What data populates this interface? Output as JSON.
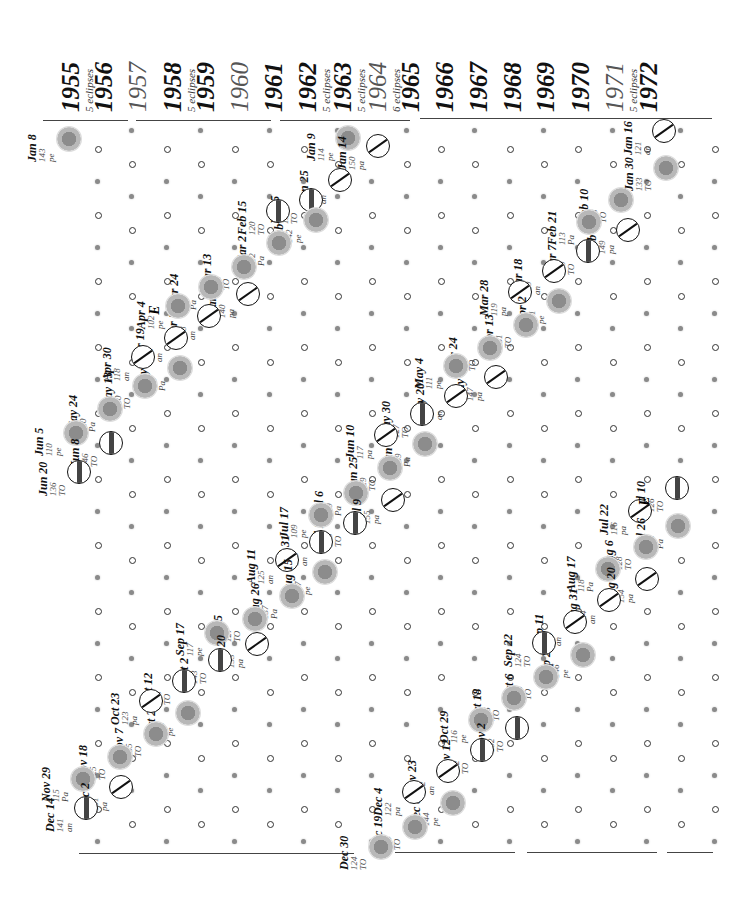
{
  "years": [
    {
      "year": "1955",
      "note": "5 eclipses",
      "style": "bold"
    },
    {
      "year": "1956",
      "note": "",
      "style": "bold"
    },
    {
      "year": "1957",
      "note": "",
      "style": "light"
    },
    {
      "year": "1958",
      "note": "5 eclipses",
      "style": "bold"
    },
    {
      "year": "1959",
      "note": "",
      "style": "bold"
    },
    {
      "year": "1960",
      "note": "",
      "style": "light"
    },
    {
      "year": "1961",
      "note": "",
      "style": "bold"
    },
    {
      "year": "1962",
      "note": "5 eclipses",
      "style": "bold"
    },
    {
      "year": "1963",
      "note": "5 eclipses",
      "style": "bold"
    },
    {
      "year": "1964",
      "note": "6 eclipses",
      "style": "light"
    },
    {
      "year": "1965",
      "note": "",
      "style": "bold"
    },
    {
      "year": "1966",
      "note": "",
      "style": "bold"
    },
    {
      "year": "1967",
      "note": "",
      "style": "bold"
    },
    {
      "year": "1968",
      "note": "",
      "style": "bold"
    },
    {
      "year": "1969",
      "note": "",
      "style": "bold"
    },
    {
      "year": "1970",
      "note": "",
      "style": "bold"
    },
    {
      "year": "1971",
      "note": "5 eclipses",
      "style": "light"
    },
    {
      "year": "1972",
      "note": "",
      "style": "bold"
    }
  ],
  "eclipses": [
    {
      "date": "Jan 8",
      "saros": "143",
      "type": "pe",
      "kind": "solar",
      "x": 68,
      "y": 138
    },
    {
      "date": "Jan 9",
      "saros": "114",
      "type": "pe",
      "kind": "solar",
      "x": 347,
      "y": 137
    },
    {
      "date": "Jan 14",
      "saros": "150",
      "type": "pa",
      "kind": "lunar",
      "x": 378,
      "y": 146
    },
    {
      "date": "Jan 25",
      "saros": "140",
      "type": "an",
      "kind": "lunar-part",
      "x": 340,
      "y": 180
    },
    {
      "date": "Feb 5",
      "saros": "130",
      "type": "TO",
      "kind": "lunar-tot",
      "x": 311,
      "y": 200
    },
    {
      "date": "Feb 19",
      "saros": "142",
      "type": "pe",
      "kind": "solar",
      "x": 315,
      "y": 219
    },
    {
      "date": "Feb 15",
      "saros": "120",
      "type": "TO",
      "kind": "lunar-tot",
      "x": 278,
      "y": 211
    },
    {
      "date": "Mar 2",
      "saros": "112",
      "type": "Pa",
      "kind": "solar",
      "x": 278,
      "y": 242
    },
    {
      "date": "Mar 13",
      "saros": "122",
      "type": "TO",
      "kind": "solar",
      "x": 243,
      "y": 266
    },
    {
      "date": "Mar 27",
      "saros": "140",
      "type": "pa",
      "kind": "lunar-part",
      "x": 248,
      "y": 294
    },
    {
      "date": "Mar 24",
      "saros": "112",
      "type": "Pa",
      "kind": "solar",
      "x": 210,
      "y": 286
    },
    {
      "date": "Apr 8",
      "saros": "138",
      "type": "an",
      "kind": "lunar-part",
      "x": 209,
      "y": 316
    },
    {
      "date": "Apr 4",
      "saros": "102",
      "type": "pe",
      "kind": "solar",
      "x": 177,
      "y": 305
    },
    {
      "date": "Apr 19",
      "saros": "128",
      "type": "an",
      "kind": "lunar-part",
      "x": 176,
      "y": 338
    },
    {
      "date": "May 3",
      "saros": "140",
      "type": "Pa",
      "kind": "solar",
      "x": 179,
      "y": 367
    },
    {
      "date": "Apr 30",
      "saros": "118",
      "type": "an",
      "kind": "lunar-part",
      "x": 143,
      "y": 357
    },
    {
      "date": "May 13",
      "saros": "130",
      "type": "TO",
      "kind": "solar",
      "x": 144,
      "y": 385
    },
    {
      "date": "May 24",
      "saros": "120",
      "type": "Pa",
      "kind": "solar",
      "x": 109,
      "y": 408
    },
    {
      "date": "Jun 5",
      "saros": "110",
      "type": "pe",
      "kind": "solar",
      "x": 75,
      "y": 432
    },
    {
      "date": "Jun 8",
      "saros": "146",
      "type": "TO",
      "kind": "lunar-tot",
      "x": 111,
      "y": 443
    },
    {
      "date": "Jun 20",
      "saros": "136",
      "type": "TO",
      "kind": "lunar-tot",
      "x": 79,
      "y": 472
    },
    {
      "date": "Feb 10",
      "saros": "123",
      "type": "TO",
      "kind": "solar",
      "x": 620,
      "y": 199
    },
    {
      "date": "Jan 30",
      "saros": "133",
      "type": "TO",
      "kind": "solar",
      "x": 665,
      "y": 167
    },
    {
      "date": "Jan 16",
      "saros": "121",
      "type": "an",
      "kind": "lunar-part",
      "x": 664,
      "y": 131
    },
    {
      "date": "Feb 25",
      "saros": "149",
      "type": "pa",
      "kind": "lunar-part",
      "x": 628,
      "y": 230
    },
    {
      "date": "Feb 21",
      "saros": "113",
      "type": "Pa",
      "kind": "solar",
      "x": 588,
      "y": 221
    },
    {
      "date": "Mar 7",
      "saros": "139",
      "type": "TO",
      "kind": "lunar-tot",
      "x": 588,
      "y": 251
    },
    {
      "date": "Mar 18",
      "saros": "129",
      "type": "an",
      "kind": "lunar-part",
      "x": 554,
      "y": 271
    },
    {
      "date": "Mar 28",
      "saros": "119",
      "type": "pa",
      "kind": "lunar-part",
      "x": 520,
      "y": 292
    },
    {
      "date": "Apr 2",
      "saros": "141",
      "type": "pe",
      "kind": "solar",
      "x": 558,
      "y": 300
    },
    {
      "date": "Apr 13",
      "saros": "131",
      "type": "TO",
      "kind": "solar",
      "x": 525,
      "y": 324
    },
    {
      "date": "Apr 24",
      "saros": "121",
      "type": "TO",
      "kind": "solar",
      "x": 489,
      "y": 347
    },
    {
      "date": "May 9",
      "saros": "147",
      "type": "pa",
      "kind": "lunar-part",
      "x": 496,
      "y": 377
    },
    {
      "date": "May 4",
      "saros": "111",
      "type": "pe",
      "kind": "solar",
      "x": 455,
      "y": 365
    },
    {
      "date": "May 20",
      "saros": "137",
      "type": "an",
      "kind": "lunar-part",
      "x": 456,
      "y": 396
    },
    {
      "date": "May 30",
      "saros": "127",
      "type": "TO",
      "kind": "lunar-tot",
      "x": 422,
      "y": 414
    },
    {
      "date": "Jun 14",
      "saros": "139",
      "type": "Pa",
      "kind": "solar",
      "x": 424,
      "y": 443
    },
    {
      "date": "Jun 10",
      "saros": "117",
      "type": "pa",
      "kind": "lunar-part",
      "x": 386,
      "y": 435
    },
    {
      "date": "Jun 25",
      "saros": "129",
      "type": "TO",
      "kind": "solar",
      "x": 389,
      "y": 467
    },
    {
      "date": "Jul 6",
      "saros": "119",
      "type": "Pa",
      "kind": "solar",
      "x": 355,
      "y": 492
    },
    {
      "date": "Jul 9",
      "saros": "155",
      "type": "pa",
      "kind": "lunar-part",
      "x": 393,
      "y": 500
    },
    {
      "date": "Jul 20",
      "saros": "145",
      "type": "TO",
      "kind": "lunar-tot",
      "x": 355,
      "y": 523
    },
    {
      "date": "Jul 17",
      "saros": "109",
      "type": "pe",
      "kind": "solar",
      "x": 320,
      "y": 514
    },
    {
      "date": "Jul 31",
      "saros": "135",
      "type": "an",
      "kind": "lunar-tot",
      "x": 321,
      "y": 542
    },
    {
      "date": "Aug 11",
      "saros": "125",
      "type": "an",
      "kind": "lunar-part",
      "x": 287,
      "y": 560
    },
    {
      "date": "Aug 15",
      "saros": "147",
      "type": "pe",
      "kind": "solar",
      "x": 324,
      "y": 571
    },
    {
      "date": "Aug 26",
      "saros": "137",
      "type": "Pa",
      "kind": "solar",
      "x": 291,
      "y": 595
    },
    {
      "date": "Sep 5",
      "saros": "127",
      "type": "TO",
      "kind": "solar",
      "x": 254,
      "y": 618
    },
    {
      "date": "Sep 17",
      "saros": "117",
      "type": "pe",
      "kind": "solar",
      "x": 216,
      "y": 632
    },
    {
      "date": "Sep 20",
      "saros": "133",
      "type": "pa",
      "kind": "lunar-part",
      "x": 257,
      "y": 644
    },
    {
      "date": "Oct 2",
      "saros": "143",
      "type": "TO",
      "kind": "lunar-tot",
      "x": 220,
      "y": 660
    },
    {
      "date": "Oct 12",
      "saros": "133",
      "type": "TO",
      "kind": "lunar-tot",
      "x": 184,
      "y": 681
    },
    {
      "date": "Oct 27",
      "saros": "145",
      "type": "pe",
      "kind": "solar",
      "x": 187,
      "y": 712
    },
    {
      "date": "Oct 23",
      "saros": "123",
      "type": "pa",
      "kind": "lunar-part",
      "x": 151,
      "y": 701
    },
    {
      "date": "Nov 7",
      "saros": "135",
      "type": "TO",
      "kind": "solar",
      "x": 155,
      "y": 733
    },
    {
      "date": "Nov 18",
      "saros": "125",
      "type": "TO",
      "kind": "solar",
      "x": 119,
      "y": 756
    },
    {
      "date": "Nov 29",
      "saros": "115",
      "type": "Pa",
      "kind": "solar",
      "x": 82,
      "y": 778
    },
    {
      "date": "Dec 2",
      "saros": "151",
      "type": "pa",
      "kind": "lunar-part",
      "x": 121,
      "y": 787
    },
    {
      "date": "Dec 14",
      "saros": "141",
      "type": "an",
      "kind": "lunar-tot",
      "x": 86,
      "y": 808
    },
    {
      "date": "Jul 10",
      "saros": "126",
      "type": "TO",
      "kind": "lunar-tot",
      "x": 677,
      "y": 488
    },
    {
      "date": "Jul 22",
      "saros": "116",
      "type": "pa",
      "kind": "lunar-part",
      "x": 640,
      "y": 511
    },
    {
      "date": "Jul 26",
      "saros": "138",
      "type": "Pa",
      "kind": "solar",
      "x": 677,
      "y": 525
    },
    {
      "date": "Aug 6",
      "saros": "128",
      "type": "TO",
      "kind": "solar",
      "x": 645,
      "y": 546
    },
    {
      "date": "Aug 17",
      "saros": "118",
      "type": "Pa",
      "kind": "solar",
      "x": 607,
      "y": 568
    },
    {
      "date": "Aug 20",
      "saros": "154",
      "type": "pa",
      "kind": "lunar-part",
      "x": 647,
      "y": 579
    },
    {
      "date": "Aug 31",
      "saros": "144",
      "type": "an",
      "kind": "lunar-part",
      "x": 609,
      "y": 600
    },
    {
      "date": "Sep 11",
      "saros": "134",
      "type": "an",
      "kind": "lunar-part",
      "x": 575,
      "y": 622
    },
    {
      "date": "Sep 25",
      "saros": "146",
      "type": "pe",
      "kind": "solar",
      "x": 582,
      "y": 654
    },
    {
      "date": "Sep 22",
      "saros": "124",
      "type": "TO",
      "kind": "lunar-tot",
      "x": 544,
      "y": 643
    },
    {
      "date": "Oct 6",
      "saros": "136",
      "type": "TO",
      "kind": "solar",
      "x": 545,
      "y": 676
    },
    {
      "date": "Oct 18",
      "saros": "126",
      "type": "TO",
      "kind": "solar",
      "x": 513,
      "y": 697
    },
    {
      "date": "Oct 29",
      "saros": "116",
      "type": "pe",
      "kind": "solar",
      "x": 480,
      "y": 719
    },
    {
      "date": "Nov 2",
      "saros": "152",
      "type": "TO",
      "kind": "lunar-tot",
      "x": 517,
      "y": 728
    },
    {
      "date": "Nov 12",
      "saros": "142",
      "type": "TO",
      "kind": "lunar-tot",
      "x": 482,
      "y": 750
    },
    {
      "date": "Nov 23",
      "saros": "132",
      "type": "an",
      "kind": "lunar-part",
      "x": 448,
      "y": 771
    },
    {
      "date": "Dec 8",
      "saros": "144",
      "type": "pe",
      "kind": "solar",
      "x": 452,
      "y": 802
    },
    {
      "date": "Dec 4",
      "saros": "122",
      "type": "pa",
      "kind": "lunar-part",
      "x": 414,
      "y": 792
    },
    {
      "date": "Dec 19",
      "saros": "134",
      "type": "TO",
      "kind": "solar",
      "x": 414,
      "y": 826
    },
    {
      "date": "Dec 30",
      "saros": "124",
      "type": "TO",
      "kind": "solar",
      "x": 380,
      "y": 846
    }
  ],
  "markers": [
    {
      "label": "E",
      "x": 150,
      "y": 302
    },
    {
      "label": "E",
      "x": 640,
      "y": 493
    }
  ],
  "legend": {
    "solar": "solar eclipse",
    "lunar": "lunar eclipse"
  }
}
